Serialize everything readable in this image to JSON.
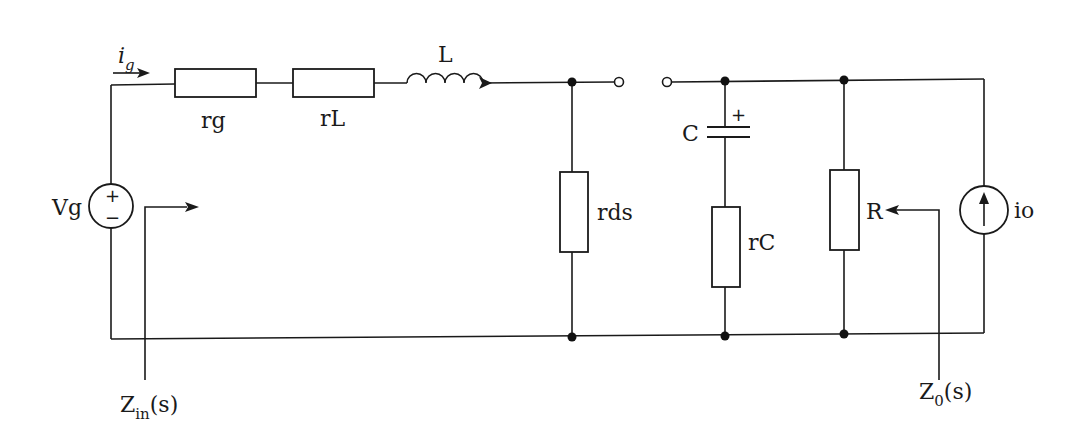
{
  "diagram": {
    "type": "circuit-schematic",
    "components": {
      "source_voltage": {
        "label": "Vg",
        "plus": "+",
        "minus": "−"
      },
      "input_current": {
        "label": "i",
        "subscript": "g"
      },
      "resistor_rg": {
        "label": "rg"
      },
      "resistor_rL": {
        "label": "rL"
      },
      "inductor": {
        "label": "L"
      },
      "resistor_rds": {
        "label": "rds"
      },
      "capacitor": {
        "label": "C",
        "polarity": "+"
      },
      "resistor_rC": {
        "label": "rC"
      },
      "resistor_R": {
        "label": "R"
      },
      "current_source": {
        "label": "io"
      }
    },
    "impedances": {
      "input": {
        "main": "Z",
        "subscript": "in",
        "suffix": "(s)"
      },
      "output": {
        "main": "Z",
        "subscript": "0",
        "suffix": "(s)"
      }
    },
    "colors": {
      "line": "#1a1a1a",
      "background": "#ffffff"
    }
  }
}
